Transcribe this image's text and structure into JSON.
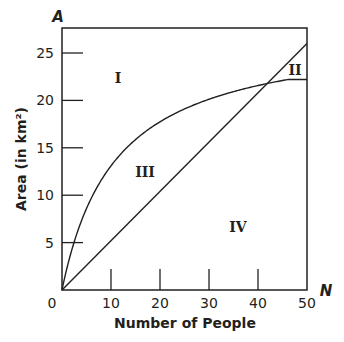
{
  "chart_data": {
    "type": "line",
    "title": "",
    "xlabel": "Number of People",
    "ylabel": "Area (in km²)",
    "x_axis_variable": "N",
    "y_axis_variable": "A",
    "xlim": [
      0,
      50
    ],
    "ylim": [
      0,
      27.6
    ],
    "x_ticks": [
      0,
      10,
      20,
      30,
      40,
      50
    ],
    "y_ticks": [
      5,
      10,
      15,
      20,
      25
    ],
    "grid": false,
    "series": [
      {
        "name": "curve",
        "shape": "saturating",
        "x": [
          0,
          2,
          5,
          8,
          10,
          15,
          20,
          25,
          30,
          35,
          40,
          42,
          45,
          50
        ],
        "y": [
          0,
          4.2,
          8.6,
          11.6,
          13.1,
          15.9,
          17.7,
          19.1,
          20.1,
          20.9,
          21.6,
          21.8,
          22.0,
          22.2
        ]
      },
      {
        "name": "line",
        "shape": "linear",
        "x": [
          0,
          50
        ],
        "y": [
          0,
          26
        ]
      }
    ],
    "intersection": {
      "x": 42,
      "y": 21.8
    },
    "region_labels": [
      {
        "label": "I",
        "x": 11.5,
        "y": 22
      },
      {
        "label": "II",
        "x": 47.5,
        "y": 23
      },
      {
        "label": "III",
        "x": 17.5,
        "y": 12.5
      },
      {
        "label": "IV",
        "x": 36,
        "y": 6.5
      }
    ]
  },
  "labels": {
    "x_title": "Number of People",
    "y_title": "Area (in km²)",
    "x_var": "N",
    "y_var": "A",
    "origin": "0",
    "x_ticks": [
      "10",
      "20",
      "30",
      "40",
      "50"
    ],
    "y_ticks": [
      "5",
      "10",
      "15",
      "20",
      "25"
    ],
    "regions": [
      "I",
      "II",
      "III",
      "IV"
    ]
  }
}
